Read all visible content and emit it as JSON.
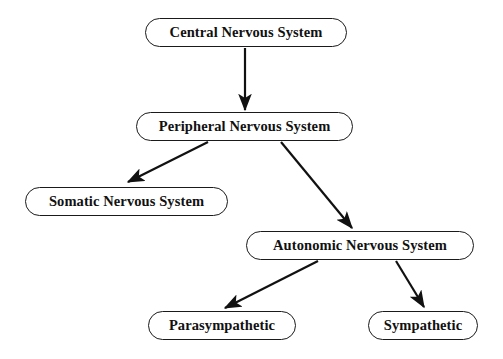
{
  "diagram": {
    "type": "flowchart",
    "background_color": "#ffffff",
    "node_border_color": "#1a1a1a",
    "text_color": "#111111",
    "arrow_color": "#111111",
    "nodes": [
      {
        "id": "central",
        "label": "Central Nervous System",
        "level": 0,
        "x": 145,
        "y": 18,
        "width": 202,
        "height": 29,
        "font_size": 14.5
      },
      {
        "id": "peripheral",
        "label": "Peripheral Nervous System",
        "level": 1,
        "x": 136,
        "y": 112,
        "width": 217,
        "height": 29,
        "font_size": 14.5
      },
      {
        "id": "somatic",
        "label": "Somatic Nervous System",
        "level": 2,
        "x": 25,
        "y": 187,
        "width": 203,
        "height": 29,
        "font_size": 14.5
      },
      {
        "id": "autonomic",
        "label": "Autonomic Nervous System",
        "level": 2,
        "x": 246,
        "y": 231,
        "width": 228,
        "height": 29,
        "font_size": 14.5
      },
      {
        "id": "parasympathetic",
        "label": "Parasympathetic",
        "level": 3,
        "x": 148,
        "y": 311,
        "width": 148,
        "height": 29,
        "font_size": 14.5
      },
      {
        "id": "sympathetic",
        "label": "Sympathetic",
        "level": 3,
        "x": 368,
        "y": 311,
        "width": 110,
        "height": 29,
        "font_size": 14.5
      }
    ],
    "edges": [
      {
        "id": "central-to-peripheral",
        "from": "central",
        "to": "peripheral",
        "x1": 245,
        "y1": 48,
        "x2": 245,
        "y2": 110,
        "direction": "down"
      },
      {
        "id": "peripheral-to-somatic",
        "from": "peripheral",
        "to": "somatic",
        "x1": 208,
        "y1": 142,
        "x2": 128,
        "y2": 182,
        "direction": "down-left"
      },
      {
        "id": "peripheral-to-autonomic",
        "from": "peripheral",
        "to": "autonomic",
        "x1": 281,
        "y1": 142,
        "x2": 352,
        "y2": 228,
        "direction": "down-right"
      },
      {
        "id": "autonomic-to-parasympathetic",
        "from": "autonomic",
        "to": "parasympathetic",
        "x1": 318,
        "y1": 261,
        "x2": 225,
        "y2": 308,
        "direction": "down-left"
      },
      {
        "id": "autonomic-to-sympathetic",
        "from": "autonomic",
        "to": "sympathetic",
        "x1": 396,
        "y1": 261,
        "x2": 424,
        "y2": 307,
        "direction": "down-right"
      }
    ]
  }
}
